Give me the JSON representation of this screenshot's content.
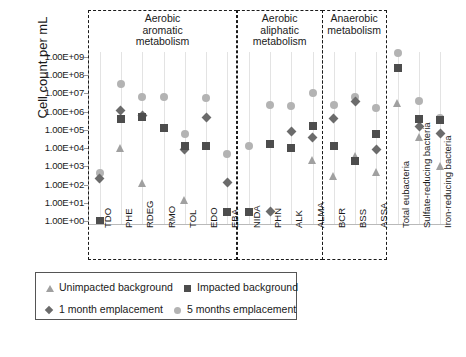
{
  "chart_data": {
    "type": "scatter",
    "title": "",
    "xlabel": "",
    "ylabel": "Cell count per mL",
    "ylim": [
      1,
      1000000000
    ],
    "yscale": "log",
    "grid": "vertical-only",
    "legend_position": "below-plot",
    "ytick_labels": [
      "1.00E+09",
      "1.00E+08",
      "1.00E+07",
      "1.00E+06",
      "1.00E+05",
      "1.00E+04",
      "1.00E+03",
      "1.00E+02",
      "1.00E+01",
      "1.00E+00"
    ],
    "ytick_exponents": [
      9,
      8,
      7,
      6,
      5,
      4,
      3,
      2,
      1,
      0
    ],
    "categories": [
      "TDO",
      "PHE",
      "RDEG",
      "RMO",
      "TOL",
      "EDO",
      "EBA",
      "NIDA",
      "PHN",
      "ALK",
      "ALMA",
      "BCR",
      "BSS",
      "ASSA",
      "Total eubacteria",
      "Sulfate-reducing bacteria",
      "Iron-reducing bacteria"
    ],
    "series": [
      {
        "name": "Unimpacted background",
        "marker": "triangle",
        "color": "#a0a0a0",
        "log_values": [
          null,
          4.0,
          2.1,
          null,
          1.15,
          null,
          null,
          null,
          null,
          null,
          3.35,
          2.45,
          3.55,
          2.7,
          6.5,
          4.6,
          3.0
        ]
      },
      {
        "name": "Impacted background",
        "marker": "square",
        "color": "#4d4d4d",
        "log_values": [
          0.0,
          5.6,
          5.7,
          5.1,
          4.1,
          4.1,
          0.5,
          0.5,
          4.2,
          4.0,
          5.2,
          4.1,
          3.3,
          4.75,
          8.4,
          5.6,
          5.55
        ]
      },
      {
        "name": "1 month emplacement",
        "marker": "diamond",
        "color": "#6b6b6b",
        "log_values": [
          2.35,
          6.05,
          5.8,
          null,
          3.95,
          5.7,
          2.1,
          null,
          0.5,
          4.9,
          4.6,
          5.6,
          6.55,
          3.95,
          null,
          5.2,
          4.8
        ]
      },
      {
        "name": "5 months emplacement",
        "marker": "circle",
        "color": "#b3b3b3",
        "log_values": [
          2.65,
          7.5,
          6.8,
          6.8,
          4.75,
          6.75,
          3.65,
          4.1,
          6.35,
          6.3,
          7.0,
          6.35,
          6.8,
          6.2,
          9.2,
          6.6,
          5.65
        ]
      }
    ]
  },
  "axis": {
    "y_title": "Cell count per mL"
  },
  "groups": [
    {
      "id": "aerobic-aromatic",
      "title": "Aerobic\naromatic\nmetabolism",
      "line1": "Aerobic",
      "line2": "aromatic",
      "line3": "metabolism",
      "start": 0,
      "end": 6
    },
    {
      "id": "aerobic-aliphatic",
      "title": "Aerobic\naliphatic\nmetabolism",
      "line1": "Aerobic",
      "line2": "aliphatic",
      "line3": "metabolism",
      "start": 7,
      "end": 10
    },
    {
      "id": "anaerobic",
      "title": "Anaerobic\nmetabolism",
      "line1": "Anaerobic",
      "line2": "metabolism",
      "line3": "",
      "start": 11,
      "end": 13
    }
  ],
  "legend": {
    "items": [
      {
        "label": "Unimpacted background",
        "marker": "triangle",
        "color": "#a0a0a0"
      },
      {
        "label": "Impacted background",
        "marker": "square",
        "color": "#4d4d4d"
      },
      {
        "label": "1 month emplacement",
        "marker": "diamond",
        "color": "#6b6b6b"
      },
      {
        "label": "5 months emplacement",
        "marker": "circle",
        "color": "#b3b3b3"
      }
    ]
  }
}
